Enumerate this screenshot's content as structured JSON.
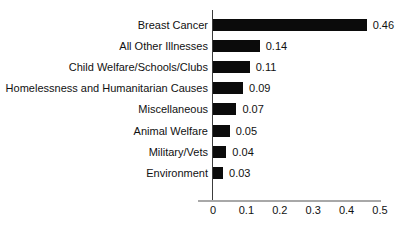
{
  "chart_data": {
    "type": "bar",
    "orientation": "horizontal",
    "title": "",
    "xlabel": "",
    "ylabel": "",
    "categories": [
      "Breast Cancer",
      "All Other Illnesses",
      "Child Welfare/Schools/Clubs",
      "Homelessness and Humanitarian Causes",
      "Miscellaneous",
      "Animal Welfare",
      "Military/Vets",
      "Environment"
    ],
    "values": [
      0.46,
      0.14,
      0.11,
      0.09,
      0.07,
      0.05,
      0.04,
      0.03
    ],
    "value_labels": [
      "0.46",
      "0.14",
      "0.11",
      "0.09",
      "0.07",
      "0.05",
      "0.04",
      "0.03"
    ],
    "xlim": [
      0,
      0.5
    ],
    "x_ticks": [
      "0",
      "0.1",
      "0.2",
      "0.3",
      "0.4",
      "0.5"
    ],
    "x_tick_values": [
      0,
      0.1,
      0.2,
      0.3,
      0.4,
      0.5
    ],
    "grid": false,
    "legend": false,
    "colors": {
      "bar": "#0b0b0b",
      "axis_line": "#a8a8a8",
      "baseline": "#3c3c3c",
      "text": "#111111",
      "background": "#ffffff"
    }
  }
}
